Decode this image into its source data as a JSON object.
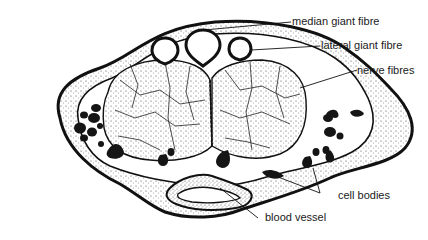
{
  "diagram": {
    "labels": {
      "median_giant_fibre": "median giant fibre",
      "lateral_giant_fibre": "lateral giant fibre",
      "nerve_fibres": "nerve fibres",
      "cell_bodies": "cell bodies",
      "blood_vessel": "blood vessel"
    },
    "colors": {
      "ink": "#111111",
      "paper": "#ffffff",
      "stipple": "#555555"
    }
  }
}
